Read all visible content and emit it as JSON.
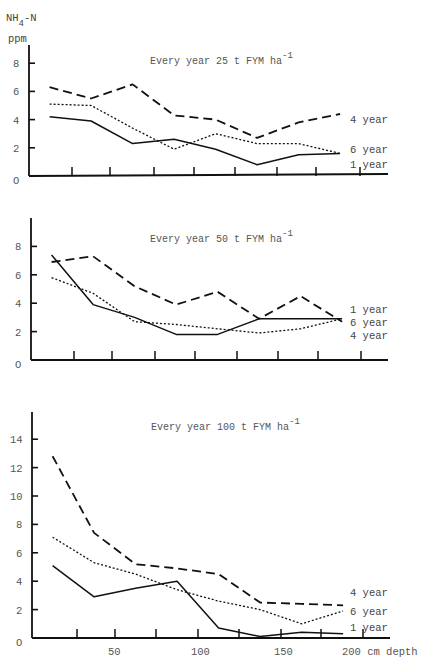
{
  "header": {
    "ylabel_line1": "NH",
    "ylabel_sub": "4",
    "ylabel_suffix": "-N",
    "ylabel_line2": "ppm"
  },
  "xaxis": {
    "ticks": [
      "50",
      "100",
      "150",
      "200 cm depth"
    ],
    "label": "cm depth"
  },
  "chart_data": [
    {
      "type": "line",
      "title": "Every year 25 t FYM ha-1",
      "title_text": "Every year 25 t FYM ha",
      "title_sup": "-1",
      "xlabel": "depth (cm)",
      "ylabel": "NH4-N ppm",
      "ylim": [
        0,
        8
      ],
      "yticks": [
        "8",
        "6",
        "4",
        "2",
        "0"
      ],
      "x": [
        10,
        35,
        60,
        85,
        110,
        135,
        160,
        185
      ],
      "series": [
        {
          "name": "4 year",
          "style": "dashed",
          "values": [
            6.3,
            5.5,
            6.5,
            4.3,
            4.0,
            2.7,
            3.8,
            4.4
          ]
        },
        {
          "name": "6 year",
          "style": "dotted",
          "values": [
            5.1,
            5.0,
            3.4,
            1.9,
            3.0,
            2.3,
            2.3,
            1.6
          ]
        },
        {
          "name": "1 year",
          "style": "solid",
          "values": [
            4.2,
            3.9,
            2.3,
            2.6,
            1.9,
            0.8,
            1.5,
            1.6
          ]
        }
      ],
      "legend_order": [
        "4 year",
        "6 year",
        "1 year"
      ]
    },
    {
      "type": "line",
      "title": "Every year 50 t FYM ha-1",
      "title_text": "Every year 50 t FYM ha",
      "title_sup": "-1",
      "xlabel": "depth (cm)",
      "ylabel": "NH4-N ppm",
      "ylim": [
        0,
        8
      ],
      "yticks": [
        "8",
        "6",
        "4",
        "2",
        "0"
      ],
      "x": [
        10,
        35,
        60,
        85,
        110,
        135,
        160,
        185
      ],
      "series": [
        {
          "name": "4 year",
          "style": "dashed",
          "values": [
            6.9,
            7.3,
            5.2,
            3.9,
            4.8,
            2.9,
            4.5,
            2.7
          ]
        },
        {
          "name": "6 year",
          "style": "dotted",
          "values": [
            5.8,
            4.7,
            2.7,
            2.5,
            2.2,
            1.9,
            2.2,
            2.9
          ]
        },
        {
          "name": "1 year",
          "style": "solid",
          "values": [
            7.4,
            3.9,
            3.0,
            1.8,
            1.8,
            2.9,
            2.9,
            2.9
          ]
        }
      ],
      "legend_order": [
        "1 year",
        "6 year",
        "4 year"
      ]
    },
    {
      "type": "line",
      "title": "Every year 100 t FYM ha-1",
      "title_text": "Every year 100 t FYM ha",
      "title_sup": "-1",
      "xlabel": "cm depth",
      "ylabel": "NH4-N ppm",
      "ylim": [
        0,
        14
      ],
      "yticks": [
        "14",
        "12",
        "10",
        "8",
        "6",
        "4",
        "2",
        "0"
      ],
      "xticks": [
        50,
        100,
        150,
        200
      ],
      "x": [
        10,
        35,
        60,
        85,
        110,
        135,
        160,
        185
      ],
      "series": [
        {
          "name": "4 year",
          "style": "dashed",
          "values": [
            12.8,
            7.4,
            5.2,
            4.9,
            4.5,
            2.5,
            2.4,
            2.3
          ]
        },
        {
          "name": "6 year",
          "style": "dotted",
          "values": [
            7.1,
            5.3,
            4.5,
            3.4,
            2.6,
            2.0,
            1.0,
            1.9
          ]
        },
        {
          "name": "1 year",
          "style": "solid",
          "values": [
            5.1,
            2.9,
            3.5,
            4.0,
            0.7,
            0.1,
            0.4,
            0.3
          ]
        }
      ],
      "legend_order": [
        "4 year",
        "6 year",
        "1 year"
      ]
    }
  ]
}
